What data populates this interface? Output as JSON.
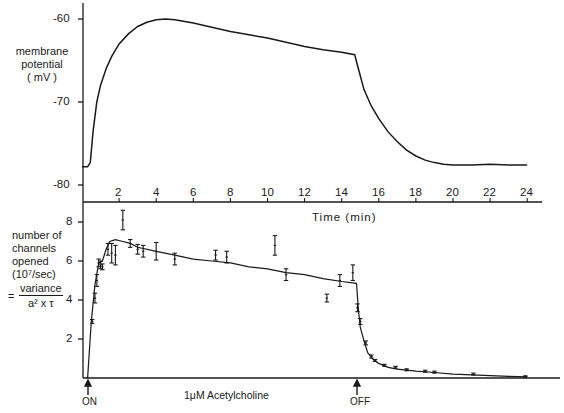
{
  "chart_data": [
    {
      "type": "line",
      "panel": "top",
      "title": "",
      "ylabel": "membrane potential (mV)",
      "ylabel_lines": [
        "membrane",
        "potential",
        "(mV)"
      ],
      "xlabel": "Time (min)",
      "ylim": [
        -80,
        -60
      ],
      "xlim": [
        0,
        24
      ],
      "yticks": [
        -60,
        -70,
        -80
      ],
      "ytick_labels": [
        "-60",
        "-70",
        "-80"
      ],
      "grid": false,
      "series": [
        {
          "name": "membrane potential",
          "x": [
            0.0,
            0.3,
            0.45,
            0.6,
            0.8,
            1.0,
            1.3,
            1.6,
            2.0,
            2.5,
            3.0,
            3.5,
            4.0,
            4.5,
            5.0,
            6.0,
            7.0,
            8.0,
            9.0,
            10.0,
            11.0,
            12.0,
            13.0,
            14.0,
            14.7,
            14.9,
            15.2,
            15.6,
            16.0,
            16.5,
            17.0,
            17.5,
            18.0,
            18.5,
            19.0,
            19.5,
            20.0,
            21.0,
            22.0,
            23.0,
            24.0
          ],
          "y": [
            -77.8,
            -77.8,
            -77.3,
            -73.5,
            -70.0,
            -68.0,
            -66.0,
            -64.5,
            -63.0,
            -61.8,
            -60.9,
            -60.4,
            -60.1,
            -60.0,
            -60.1,
            -60.5,
            -61.0,
            -61.5,
            -61.9,
            -62.3,
            -62.8,
            -63.3,
            -63.7,
            -64.0,
            -64.3,
            -66.0,
            -68.5,
            -70.5,
            -72.0,
            -73.6,
            -74.8,
            -75.8,
            -76.5,
            -77.0,
            -77.3,
            -77.5,
            -77.6,
            -77.6,
            -77.5,
            -77.6,
            -77.6
          ]
        }
      ]
    },
    {
      "type": "line",
      "panel": "bottom",
      "title": "",
      "ylabel": "number of channels opened (10^7/sec) = variance / (a^2 x tau)",
      "ylabel_lines": [
        "number of",
        "channels",
        "opened",
        "(10⁷/sec)"
      ],
      "formula": {
        "numerator": "variance",
        "denominator": "a² x τ",
        "prefix": "="
      },
      "xlabel": "Time (min)",
      "xticks": [
        2,
        4,
        6,
        8,
        10,
        12,
        14,
        16,
        18,
        20,
        22,
        24
      ],
      "xtick_labels": [
        "2",
        "4",
        "6",
        "8",
        "10",
        "12",
        "14",
        "16",
        "18",
        "20",
        "22",
        "24"
      ],
      "ylim": [
        0,
        8.6
      ],
      "xlim": [
        0,
        24
      ],
      "yticks": [
        2,
        4,
        6,
        8
      ],
      "ytick_labels": [
        "2",
        "4",
        "6",
        "8"
      ],
      "grid": false,
      "fit_line": {
        "x": [
          0.3,
          0.5,
          0.7,
          0.9,
          1.1,
          1.3,
          1.5,
          1.8,
          2.2,
          2.6,
          3.0,
          4.0,
          5.0,
          6.0,
          7.0,
          8.0,
          9.0,
          10.0,
          11.0,
          12.0,
          13.0,
          14.0,
          14.8,
          14.9,
          15.0,
          15.2,
          15.4,
          15.7,
          16.0,
          16.5,
          17.0,
          18.0,
          19.0,
          20.0,
          21.0,
          22.0,
          23.0,
          24.0
        ],
        "y": [
          0.0,
          2.9,
          4.8,
          5.9,
          6.0,
          6.6,
          7.0,
          7.1,
          7.0,
          6.9,
          6.7,
          6.5,
          6.3,
          6.1,
          6.0,
          5.9,
          5.7,
          5.6,
          5.4,
          5.3,
          5.1,
          4.95,
          4.85,
          3.5,
          2.6,
          1.9,
          1.3,
          0.95,
          0.75,
          0.55,
          0.45,
          0.35,
          0.28,
          0.2,
          0.16,
          0.12,
          0.08,
          0.06
        ]
      },
      "points": [
        {
          "x": 0.55,
          "y": 2.9,
          "err": 0.1
        },
        {
          "x": 0.7,
          "y": 4.1,
          "err": 0.25
        },
        {
          "x": 0.8,
          "y": 5.0,
          "err": 0.3
        },
        {
          "x": 0.9,
          "y": 5.9,
          "err": 0.2
        },
        {
          "x": 1.0,
          "y": 5.8,
          "err": 0.2
        },
        {
          "x": 1.1,
          "y": 5.7,
          "err": 0.15
        },
        {
          "x": 1.4,
          "y": 6.6,
          "err": 0.3
        },
        {
          "x": 1.6,
          "y": 6.4,
          "err": 0.5
        },
        {
          "x": 1.8,
          "y": 6.3,
          "err": 0.5
        },
        {
          "x": 2.2,
          "y": 8.1,
          "err": 0.5
        },
        {
          "x": 2.6,
          "y": 6.9,
          "err": 0.2
        },
        {
          "x": 3.0,
          "y": 6.6,
          "err": 0.25
        },
        {
          "x": 3.3,
          "y": 6.5,
          "err": 0.3
        },
        {
          "x": 4.0,
          "y": 6.5,
          "err": 0.45
        },
        {
          "x": 5.0,
          "y": 6.1,
          "err": 0.3
        },
        {
          "x": 7.2,
          "y": 6.3,
          "err": 0.25
        },
        {
          "x": 7.8,
          "y": 6.2,
          "err": 0.3
        },
        {
          "x": 10.4,
          "y": 6.8,
          "err": 0.5
        },
        {
          "x": 11.0,
          "y": 5.3,
          "err": 0.3
        },
        {
          "x": 13.2,
          "y": 4.1,
          "err": 0.2
        },
        {
          "x": 13.9,
          "y": 5.0,
          "err": 0.3
        },
        {
          "x": 14.6,
          "y": 5.4,
          "err": 0.4
        },
        {
          "x": 14.85,
          "y": 3.6,
          "err": 0.2
        },
        {
          "x": 15.0,
          "y": 2.9,
          "err": 0.15
        },
        {
          "x": 15.3,
          "y": 1.8,
          "err": 0.1
        },
        {
          "x": 15.6,
          "y": 1.1,
          "err": 0.08
        },
        {
          "x": 15.8,
          "y": 0.9,
          "err": 0.05
        },
        {
          "x": 16.3,
          "y": 0.65,
          "err": 0.05
        },
        {
          "x": 16.9,
          "y": 0.55,
          "err": 0.05
        },
        {
          "x": 17.5,
          "y": 0.42,
          "err": 0.05
        },
        {
          "x": 18.5,
          "y": 0.35,
          "err": 0.05
        },
        {
          "x": 19.0,
          "y": 0.3,
          "err": 0.05
        },
        {
          "x": 21.1,
          "y": 0.2,
          "err": 0.05
        },
        {
          "x": 23.9,
          "y": 0.08,
          "err": 0.03
        }
      ],
      "annotations": [
        {
          "text": "ON",
          "x": 0.3,
          "arrow": "up"
        },
        {
          "text": "OFF",
          "x": 14.8,
          "arrow": "up"
        },
        {
          "text": "1μM Acetylcholine",
          "x": 7.5
        }
      ]
    }
  ],
  "labels": {
    "top_ylabel_1": "membrane",
    "top_ylabel_2": "potential",
    "top_ylabel_3": "( mV )",
    "top_yticks": [
      "-60",
      "-70",
      "-80"
    ],
    "xticks": [
      "2",
      "4",
      "6",
      "8",
      "10",
      "12",
      "14",
      "16",
      "18",
      "20",
      "22",
      "24"
    ],
    "xlabel": "Time  (min)",
    "bot_ylabel_1": "number of",
    "bot_ylabel_2": "channels",
    "bot_ylabel_3": "opened",
    "bot_ylabel_4": "(10⁷/sec)",
    "eq_prefix": "=",
    "eq_numerator": "variance",
    "eq_denominator": "a² x τ",
    "bot_yticks": [
      "8",
      "6",
      "4",
      "2"
    ],
    "on_label": "ON",
    "off_label": "OFF",
    "drug_label": "1μM Acetylcholine"
  },
  "colors": {
    "ink": "#1a1a1a",
    "background": "#ffffff"
  }
}
